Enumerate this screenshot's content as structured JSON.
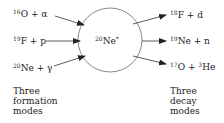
{
  "nucleus": {
    "mass": "20",
    "symbol": "Ne",
    "state": "*"
  },
  "formation": {
    "reactions": [
      {
        "mass": "16",
        "symbol": "O",
        "rest": " + α"
      },
      {
        "mass": "19",
        "symbol": "F",
        "rest": " + p"
      },
      {
        "mass": "20",
        "symbol": "Ne",
        "rest": " + γ"
      }
    ],
    "caption": [
      "Three",
      "formation",
      "modes"
    ]
  },
  "decay": {
    "reactions": [
      {
        "mass": "18",
        "symbol": "F",
        "rest": " + d"
      },
      {
        "mass": "19",
        "symbol": "Ne",
        "rest": " + n"
      },
      {
        "mass": "17",
        "symbol": "O",
        "rest": " + ",
        "mass2": "3",
        "symbol2": "He"
      }
    ],
    "caption": [
      "Three",
      "decay",
      "modes"
    ]
  },
  "colors": {
    "line": "#333333",
    "circle": "#888888"
  }
}
